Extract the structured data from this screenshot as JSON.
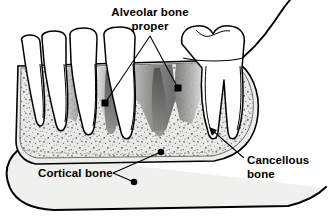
{
  "figure": {
    "background_color": "#ffffff",
    "line_color": "#000000"
  },
  "labels": [
    {
      "id": "alveolar-bone-proper",
      "line1": "Alveolar bone",
      "line2": "proper",
      "anchor": "middle",
      "x": 150,
      "y1": 16,
      "y2": 30,
      "leader": {
        "apex_x": 150,
        "apex_y": 36,
        "endpoints": [
          {
            "x": 105,
            "y": 103,
            "marker": "square"
          },
          {
            "x": 178,
            "y": 88,
            "marker": "square"
          }
        ]
      }
    },
    {
      "id": "cancellous-bone",
      "line1": "Cancellous",
      "line2": "bone",
      "anchor": "start",
      "x": 247,
      "y1": 164,
      "y2": 178,
      "leader": {
        "from_x": 244,
        "from_y": 158,
        "to_x": 209,
        "to_y": 128,
        "marker": "arrow"
      }
    },
    {
      "id": "cortical-bone",
      "line1": "Cortical bone",
      "line2": "",
      "anchor": "start",
      "x": 38,
      "y1": 177,
      "y2": null,
      "leader": {
        "fork_x": 113,
        "fork_y": 173,
        "endpoints": [
          {
            "x": 161,
            "y": 152,
            "marker": "dot"
          },
          {
            "x": 134,
            "y": 182,
            "marker": "dot"
          }
        ]
      }
    }
  ],
  "regions": [
    {
      "id": "cancellous-bone-region",
      "name": "Cancellous bone",
      "fill": "#e8e8e6",
      "texture": "stipple"
    },
    {
      "id": "cortical-bone-region",
      "name": "Cortical bone",
      "fill": "#ececea"
    },
    {
      "id": "alveolar-bone-proper-region",
      "name": "Alveolar bone proper",
      "fill": "gradient-gray"
    },
    {
      "id": "mandible-body-region",
      "name": "Mandible body",
      "fill": "#efefed"
    },
    {
      "id": "teeth-region",
      "name": "Teeth",
      "fill": "#ffffff"
    }
  ],
  "teeth": [
    {
      "id": "tooth-1",
      "type": "incisor"
    },
    {
      "id": "tooth-2",
      "type": "incisor"
    },
    {
      "id": "tooth-3",
      "type": "incisor"
    },
    {
      "id": "tooth-4",
      "type": "canine"
    },
    {
      "id": "tooth-5",
      "type": "molar",
      "roots": 2
    }
  ],
  "colors": {
    "outline": "#000000",
    "cancellous_fill": "#e9e9e7",
    "cortical_fill": "#ededeb",
    "body_fill": "#f0f0ee",
    "alveolar_dark": "#6e6e6e",
    "alveolar_light": "#d5d5d3",
    "stipple": "#5a5a5a",
    "tooth_fill": "#ffffff"
  }
}
